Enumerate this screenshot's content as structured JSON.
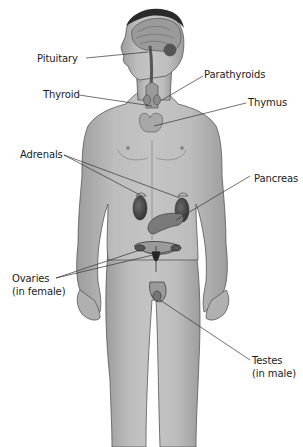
{
  "diagram": {
    "colors": {
      "skin": "#b7b7b7",
      "skin_shadow": "#8f8f8f",
      "outline": "#555555",
      "organ": "#7a7a7a",
      "organ_dark": "#3f3f3f",
      "hair": "#2a2a2a",
      "leader_line": "#333333",
      "text": "#1a1a1a",
      "background": "#ffffff"
    },
    "labels": [
      {
        "id": "pituitary",
        "lines": [
          "Pituitary"
        ]
      },
      {
        "id": "parathyroids",
        "lines": [
          "Parathyroids"
        ]
      },
      {
        "id": "thyroid",
        "lines": [
          "Thyroid"
        ]
      },
      {
        "id": "thymus",
        "lines": [
          "Thymus"
        ]
      },
      {
        "id": "adrenals",
        "lines": [
          "Adrenals"
        ]
      },
      {
        "id": "pancreas",
        "lines": [
          "Pancreas"
        ]
      },
      {
        "id": "ovaries",
        "lines": [
          "Ovaries",
          "(in female)"
        ]
      },
      {
        "id": "testes",
        "lines": [
          "Testes",
          "(in male)"
        ]
      }
    ]
  }
}
